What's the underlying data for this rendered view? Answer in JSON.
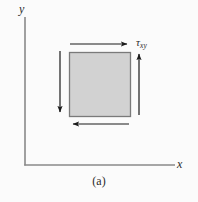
{
  "figure": {
    "caption": "(a)",
    "background_color": "#fbfbfb",
    "axes": {
      "x_label": "x",
      "y_label": "y",
      "line_color": "#8a8a8a",
      "origin": [
        25,
        165
      ],
      "x_end": [
        175,
        165
      ],
      "y_end": [
        25,
        17
      ]
    },
    "element": {
      "name": "stress-element-square",
      "fill_color": "#d2d2d2",
      "stroke_color": "#7a7a7a",
      "left": 69,
      "top": 52,
      "width": 62,
      "height": 65
    },
    "stress_label": {
      "symbol": "τ",
      "subscript": "xy",
      "color": "#2b2b2b"
    },
    "arrows": [
      {
        "name": "top-shear-arrow",
        "direction": "right",
        "x1": 70,
        "y1": 44,
        "x2": 129,
        "y2": 44,
        "color": "#1a1a1a"
      },
      {
        "name": "right-shear-arrow",
        "direction": "up",
        "x1": 139,
        "y1": 115,
        "x2": 139,
        "y2": 52,
        "color": "#1a1a1a"
      },
      {
        "name": "bottom-shear-arrow",
        "direction": "left",
        "x1": 129,
        "y1": 124,
        "x2": 71,
        "y2": 124,
        "color": "#1a1a1a"
      },
      {
        "name": "left-shear-arrow",
        "direction": "down",
        "x1": 60,
        "y1": 51,
        "x2": 60,
        "y2": 114,
        "color": "#1a1a1a"
      }
    ]
  }
}
